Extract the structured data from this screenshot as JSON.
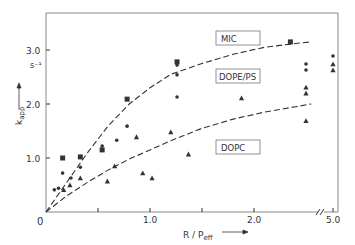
{
  "chart_data": {
    "type": "scatter",
    "title": "",
    "xlabel": "R / P",
    "xlabel_sub": "eff",
    "ylabel": "k",
    "ylabel_sub": "app",
    "y_unit": "s⁻¹",
    "origin_label": "0",
    "x_ticks": [
      {
        "value": 0.5,
        "label": ""
      },
      {
        "value": 1.0,
        "label": "1.0"
      },
      {
        "value": 1.5,
        "label": ""
      },
      {
        "value": 2.0,
        "label": "2.0"
      },
      {
        "value": 5.0,
        "label": "5.0",
        "after_break": true
      }
    ],
    "y_ticks": [
      {
        "value": 1.0,
        "label": "1.0"
      },
      {
        "value": 2.0,
        "label": "2.0"
      },
      {
        "value": 3.0,
        "label": "3.0"
      }
    ],
    "xlim": [
      0,
      2.75
    ],
    "ylim": [
      0,
      3.75
    ],
    "axis_break": {
      "axis": "x",
      "between": [
        2.6,
        5.0
      ]
    },
    "grid": false,
    "series": [
      {
        "name": "MIC",
        "marker": "square",
        "points": [
          [
            0.16,
            1.0
          ],
          [
            0.33,
            1.02
          ],
          [
            0.54,
            1.15
          ],
          [
            0.78,
            2.09
          ],
          [
            1.26,
            2.78
          ],
          [
            2.35,
            3.15
          ]
        ]
      },
      {
        "name": "DOPE/PS",
        "marker": "circle",
        "points": [
          [
            0.08,
            0.41
          ],
          [
            0.12,
            0.44
          ],
          [
            0.16,
            0.72
          ],
          [
            0.24,
            0.63
          ],
          [
            0.33,
            0.83
          ],
          [
            0.54,
            1.22
          ],
          [
            0.68,
            1.33
          ],
          [
            0.78,
            1.59
          ],
          [
            1.26,
            2.72
          ],
          [
            1.26,
            2.54
          ],
          [
            1.26,
            2.13
          ],
          [
            2.5,
            2.74
          ],
          [
            2.5,
            2.63
          ],
          [
            5.0,
            2.89
          ]
        ]
      },
      {
        "name": "DOPC",
        "marker": "triangle",
        "points": [
          [
            0.17,
            0.41
          ],
          [
            0.23,
            0.5
          ],
          [
            0.33,
            0.63
          ],
          [
            0.59,
            0.57
          ],
          [
            0.66,
            0.85
          ],
          [
            0.87,
            1.39
          ],
          [
            0.93,
            0.72
          ],
          [
            1.02,
            0.63
          ],
          [
            1.2,
            1.48
          ],
          [
            1.37,
            1.07
          ],
          [
            1.88,
            2.11
          ],
          [
            2.5,
            2.31
          ],
          [
            2.5,
            2.2
          ],
          [
            2.5,
            1.69
          ],
          [
            5.0,
            2.74
          ],
          [
            5.0,
            2.63
          ]
        ]
      }
    ],
    "fit_curves": [
      {
        "name": "MIC fit",
        "style": "dashed",
        "points": [
          [
            0,
            0
          ],
          [
            0.2,
            0.55
          ],
          [
            0.4,
            1.1
          ],
          [
            0.6,
            1.6
          ],
          [
            0.8,
            2.0
          ],
          [
            1.0,
            2.3
          ],
          [
            1.2,
            2.55
          ],
          [
            1.5,
            2.75
          ],
          [
            1.8,
            2.92
          ],
          [
            2.1,
            3.05
          ],
          [
            2.4,
            3.12
          ],
          [
            2.55,
            3.15
          ]
        ]
      },
      {
        "name": "DOPC fit",
        "style": "dashed",
        "points": [
          [
            0,
            0
          ],
          [
            0.2,
            0.3
          ],
          [
            0.4,
            0.55
          ],
          [
            0.6,
            0.78
          ],
          [
            0.8,
            0.98
          ],
          [
            1.0,
            1.15
          ],
          [
            1.2,
            1.32
          ],
          [
            1.5,
            1.55
          ],
          [
            1.8,
            1.72
          ],
          [
            2.1,
            1.85
          ],
          [
            2.4,
            1.95
          ],
          [
            2.55,
            2.0
          ]
        ]
      }
    ],
    "annotations": [
      {
        "text": "MIC",
        "boxed": true
      },
      {
        "text": "DOPE/PS",
        "boxed": true
      },
      {
        "text": "DOPC",
        "boxed": true
      }
    ]
  },
  "labels": {
    "mic": "MIC",
    "dopeps": "DOPE/PS",
    "dopc": "DOPC",
    "y_unit": "s⁻¹",
    "origin": "0",
    "xtick_1": "1.0",
    "xtick_2": "2.0",
    "xtick_5": "5.0",
    "ytick_1": "1.0",
    "ytick_2": "2.0",
    "ytick_3": "3.0",
    "xlabel_main": "R / P",
    "xlabel_sub": "eff",
    "ylabel_main": "k",
    "ylabel_sub": "app"
  },
  "colors": {
    "ink": "#333333",
    "frame": "#888888",
    "background": "#ffffff"
  }
}
